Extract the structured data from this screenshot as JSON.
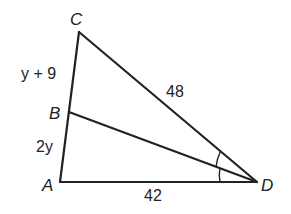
{
  "diagram": {
    "type": "geometry-triangle",
    "colors": {
      "stroke": "#222222",
      "background": "#ffffff"
    },
    "points": {
      "A": {
        "label": "A",
        "x": 60,
        "y": 182
      },
      "B": {
        "label": "B",
        "x": 69,
        "y": 112
      },
      "C": {
        "label": "C",
        "x": 79,
        "y": 32
      },
      "D": {
        "label": "D",
        "x": 257,
        "y": 182
      }
    },
    "segments": {
      "CB": {
        "label": "y + 9"
      },
      "BA": {
        "label": "2y"
      },
      "CD": {
        "label": "48"
      },
      "AD": {
        "label": "42"
      }
    },
    "angle_marks": [
      "angle CDB",
      "angle BDA"
    ]
  }
}
